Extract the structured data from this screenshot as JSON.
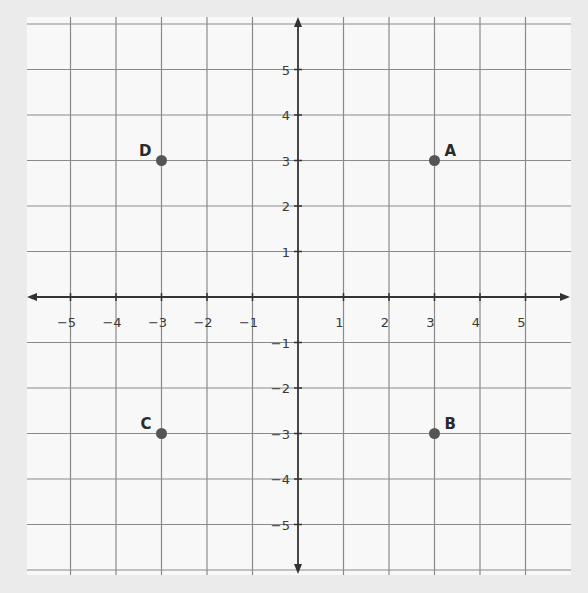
{
  "chart_data": {
    "type": "scatter",
    "title": "",
    "xlabel": "",
    "ylabel": "",
    "xlim": [
      -5.5,
      6
    ],
    "ylim": [
      -6,
      6
    ],
    "grid": true,
    "x_ticks": [
      -5,
      -4,
      -3,
      -2,
      -1,
      1,
      2,
      3,
      4,
      5
    ],
    "y_ticks": [
      5,
      4,
      3,
      2,
      1,
      -1,
      -2,
      -3,
      -4,
      -5
    ],
    "x_tick_labels": [
      "−5",
      "−4",
      "−3",
      "−2",
      "−1",
      "1",
      "2",
      "3",
      "4",
      "5"
    ],
    "y_tick_labels": [
      "5",
      "4",
      "3",
      "2",
      "1",
      "−1",
      "−2",
      "−3",
      "−4",
      "−5"
    ],
    "points": [
      {
        "label": "A",
        "x": 3,
        "y": 3
      },
      {
        "label": "B",
        "x": 3,
        "y": -3
      },
      {
        "label": "C",
        "x": -3,
        "y": -3
      },
      {
        "label": "D",
        "x": -3,
        "y": 3
      }
    ],
    "colors": {
      "background": "#ebebeb",
      "panel": "#f8f8f8",
      "grid": "#8a8a8a",
      "axis": "#333333",
      "point": "#555555",
      "text": "#2a2a2a"
    }
  }
}
